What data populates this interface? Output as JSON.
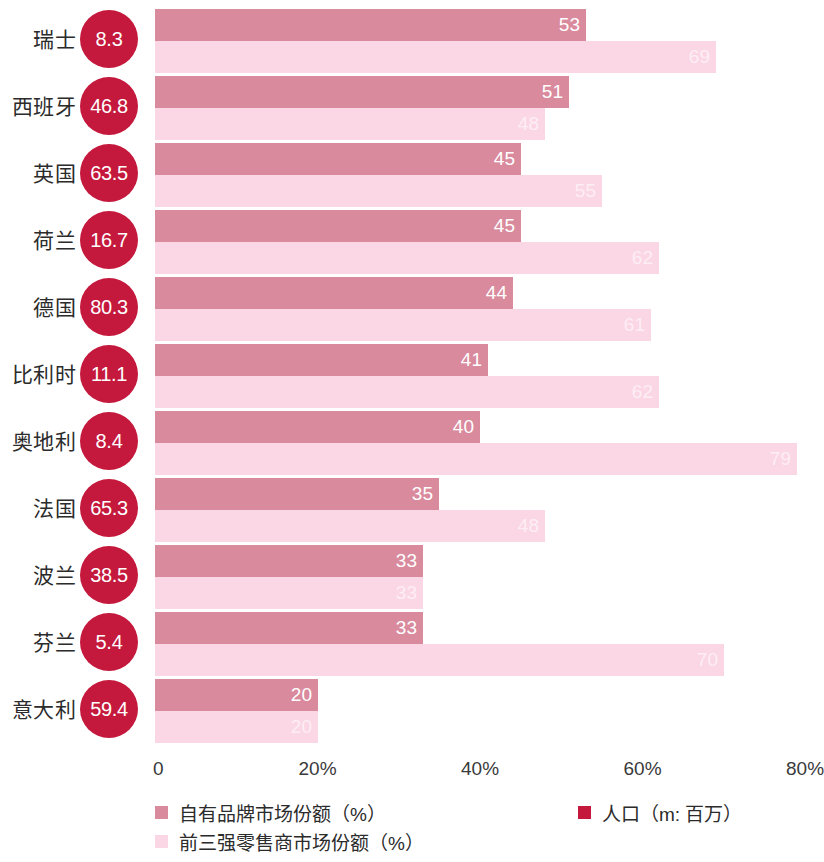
{
  "chart_data": {
    "type": "bar",
    "orientation": "horizontal",
    "title": "",
    "subtitle": "",
    "xlabel": "",
    "ylabel": "",
    "xlim": [
      0,
      80
    ],
    "grid": false,
    "legend_position": "bottom",
    "categories": [
      "瑞士",
      "西班牙",
      "英国",
      "荷兰",
      "德国",
      "比利时",
      "奥地利",
      "法国",
      "波兰",
      "芬兰",
      "意大利"
    ],
    "tick_labels": [
      "0",
      "20%",
      "40%",
      "60%",
      "80%"
    ],
    "tick_values": [
      0,
      20,
      40,
      60,
      80
    ],
    "series": [
      {
        "name": "自有品牌市场份额（%）",
        "color": "#d98a9d",
        "values": [
          53,
          51,
          45,
          45,
          44,
          41,
          40,
          35,
          33,
          33,
          20
        ]
      },
      {
        "name": "前三强零售商市场份额（%）",
        "color": "#fbd6e5",
        "values": [
          69,
          48,
          55,
          62,
          61,
          62,
          79,
          48,
          33,
          70,
          20
        ]
      }
    ],
    "annotations": {
      "name": "人口（m: 百万）",
      "color": "#c4183c",
      "values": [
        8.3,
        46.8,
        63.5,
        16.7,
        80.3,
        11.1,
        8.4,
        65.3,
        38.5,
        5.4,
        59.4
      ]
    },
    "rows": [
      {
        "country": "瑞士",
        "population": "8.3",
        "private_label": 53,
        "top3_retailers": 69
      },
      {
        "country": "西班牙",
        "population": "46.8",
        "private_label": 51,
        "top3_retailers": 48
      },
      {
        "country": "英国",
        "population": "63.5",
        "private_label": 45,
        "top3_retailers": 55
      },
      {
        "country": "荷兰",
        "population": "16.7",
        "private_label": 45,
        "top3_retailers": 62
      },
      {
        "country": "德国",
        "population": "80.3",
        "private_label": 44,
        "top3_retailers": 61
      },
      {
        "country": "比利时",
        "population": "11.1",
        "private_label": 41,
        "top3_retailers": 62
      },
      {
        "country": "奥地利",
        "population": "8.4",
        "private_label": 40,
        "top3_retailers": 79
      },
      {
        "country": "法国",
        "population": "65.3",
        "private_label": 35,
        "top3_retailers": 48
      },
      {
        "country": "波兰",
        "population": "38.5",
        "private_label": 33,
        "top3_retailers": 33
      },
      {
        "country": "芬兰",
        "population": "5.4",
        "private_label": 33,
        "top3_retailers": 70
      },
      {
        "country": "意大利",
        "population": "59.4",
        "private_label": 20,
        "top3_retailers": 20
      }
    ]
  },
  "legend": {
    "private_label": "自有品牌市场份额（%）",
    "top3_retailers": "前三强零售商市场份额（%）",
    "population": "人口（m: 百万）"
  },
  "axis": {
    "ticks": [
      "0",
      "20%",
      "40%",
      "60%",
      "80%"
    ]
  },
  "colors": {
    "bar_dark": "#d98a9d",
    "bar_light": "#fbd6e5",
    "population_circle": "#c4183c",
    "background": "#ffffff",
    "text": "#2b2b2b"
  }
}
